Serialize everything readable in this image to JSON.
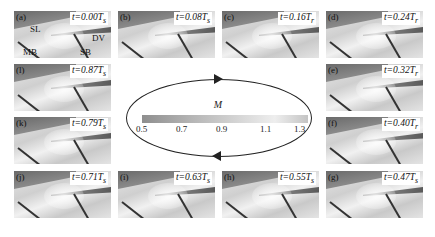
{
  "figure": {
    "panels": [
      {
        "id": "a",
        "label": "(a)",
        "time": "t=0.00T",
        "subscript": "s",
        "col": 0,
        "row": 0
      },
      {
        "id": "b",
        "label": "(b)",
        "time": "t=0.08T",
        "subscript": "s",
        "col": 1,
        "row": 0
      },
      {
        "id": "c",
        "label": "(c)",
        "time": "t=0.16T",
        "subscript": "r",
        "col": 2,
        "row": 0
      },
      {
        "id": "d",
        "label": "(d)",
        "time": "t=0.24T",
        "subscript": "r",
        "col": 3,
        "row": 0
      },
      {
        "id": "e",
        "label": "(e)",
        "time": "t=0.32T",
        "subscript": "r",
        "col": 3,
        "row": 1
      },
      {
        "id": "f",
        "label": "(f)",
        "time": "t=0.40T",
        "subscript": "r",
        "col": 3,
        "row": 2
      },
      {
        "id": "g",
        "label": "(g)",
        "time": "t=0.47T",
        "subscript": "s",
        "col": 3,
        "row": 3
      },
      {
        "id": "h",
        "label": "(h)",
        "time": "t=0.55T",
        "subscript": "s",
        "col": 2,
        "row": 3
      },
      {
        "id": "i",
        "label": "(i)",
        "time": "t=0.63T",
        "subscript": "s",
        "col": 1,
        "row": 3
      },
      {
        "id": "j",
        "label": "(j)",
        "time": "t=0.71T",
        "subscript": "s",
        "col": 0,
        "row": 3
      },
      {
        "id": "k",
        "label": "(k)",
        "time": "t=0.79T",
        "subscript": "s",
        "col": 0,
        "row": 2
      },
      {
        "id": "l",
        "label": "(l)",
        "time": "t=0.87T",
        "subscript": "s",
        "col": 0,
        "row": 1
      }
    ],
    "annotations": {
      "SL": "SL",
      "DV": "DV",
      "MB": "MB",
      "SB": "SB"
    },
    "colorbar": {
      "variable": "M",
      "ticks": [
        "0.5",
        "0.7",
        "0.9",
        "1.1",
        "1.3"
      ],
      "range": [
        0.5,
        1.3
      ]
    },
    "cycle_direction": "clockwise"
  }
}
